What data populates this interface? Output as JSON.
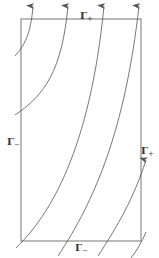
{
  "diagram": {
    "colors": {
      "boundary": "#666666",
      "curve": "#555555",
      "label": "#333333",
      "background": "#ffffff"
    },
    "boundary_labels": {
      "top": {
        "symbol": "Γ",
        "sub": "+"
      },
      "left": {
        "symbol": "Γ",
        "sub": "−"
      },
      "right": {
        "symbol": "Γ",
        "sub": "+"
      },
      "bottom": {
        "symbol": "Γ",
        "sub": "−"
      }
    },
    "rectangle": {
      "x": 21,
      "y": 19,
      "width": 120,
      "height": 222
    },
    "flow_lines": [
      {
        "id": 1,
        "path": "M 15 52 C 25 42, 31 30, 33 8",
        "arrow_at": [
          33,
          5
        ]
      },
      {
        "id": 2,
        "path": "M 36 92 C 22 110, 14 118, 13 120",
        "arrow_at": null
      },
      {
        "id": 3,
        "path": "M 24 194 C 55 170, 64 120, 68 8",
        "arrow_at": [
          68,
          5
        ]
      },
      {
        "id": 4,
        "path": "M 61 254 C 85 210, 95 120, 104 8",
        "arrow_at": [
          104,
          5
        ]
      },
      {
        "id": 5,
        "path": "M 98 256 C 120 200, 132 120, 139 8",
        "arrow_at": [
          139,
          5
        ]
      },
      {
        "id": 6,
        "path": "M 130 258 C 140 230, 143 200, 146 165",
        "arrow_at": [
          146,
          162
        ]
      }
    ]
  }
}
